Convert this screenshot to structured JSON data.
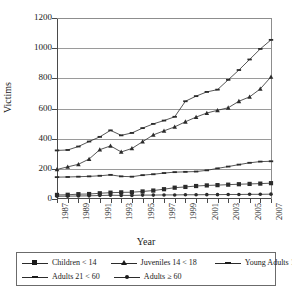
{
  "chart_data": {
    "type": "line",
    "title": "",
    "xlabel": "Year",
    "ylabel": "Victims",
    "ylim": [
      0,
      1200
    ],
    "ytick_values": [
      0,
      200,
      400,
      600,
      800,
      1000,
      1200
    ],
    "ytick_labels": [
      "0",
      "200",
      "400",
      "600",
      "800",
      "1000",
      "1200"
    ],
    "grid": true,
    "legend_position": "bottom",
    "x": [
      1987,
      1988,
      1989,
      1990,
      1991,
      1992,
      1993,
      1994,
      1995,
      1996,
      1997,
      1998,
      1999,
      2000,
      2001,
      2002,
      2003,
      2004,
      2005,
      2006,
      2007
    ],
    "xtick_labels": [
      "1987",
      "1989",
      "1991",
      "1993",
      "1995",
      "1997",
      "1999",
      "2001",
      "2003",
      "2005",
      "2007"
    ],
    "xtick_years": [
      1987,
      1989,
      1991,
      1993,
      1995,
      1997,
      1999,
      2001,
      2003,
      2005,
      2007
    ],
    "series": [
      {
        "name": "Children < 14",
        "marker": "square",
        "values": [
          27,
          28,
          32,
          33,
          38,
          42,
          44,
          45,
          50,
          56,
          65,
          75,
          80,
          86,
          90,
          92,
          95,
          98,
          100,
          102,
          105
        ]
      },
      {
        "name": "Juveniles 14 < 18",
        "marker": "triangle",
        "values": [
          196,
          213,
          230,
          265,
          327,
          352,
          312,
          335,
          380,
          425,
          452,
          478,
          512,
          543,
          570,
          588,
          605,
          648,
          677,
          730,
          810
        ]
      },
      {
        "name": "Young Adults 18 < 21",
        "marker": "dash",
        "values": [
          322,
          325,
          348,
          381,
          412,
          455,
          422,
          438,
          470,
          498,
          520,
          545,
          648,
          682,
          710,
          725,
          790,
          855,
          925,
          995,
          1055
        ]
      },
      {
        "name": "Adults 21 < 60",
        "marker": "dash",
        "values": [
          145,
          146,
          148,
          150,
          154,
          160,
          150,
          148,
          158,
          164,
          172,
          178,
          180,
          182,
          190,
          203,
          215,
          228,
          240,
          248,
          250
        ]
      },
      {
        "name": "Adults ≥ 60",
        "marker": "dot",
        "values": [
          18,
          19,
          20,
          21,
          23,
          25,
          24,
          24,
          26,
          26,
          27,
          27,
          28,
          28,
          29,
          29,
          30,
          30,
          31,
          31,
          32
        ]
      }
    ]
  },
  "legend": {
    "items": [
      {
        "label": "Children < 14",
        "marker": "square"
      },
      {
        "label": "Juveniles 14 < 18",
        "marker": "triangle"
      },
      {
        "label": "Young Adults 18 < 21",
        "marker": "dash"
      },
      {
        "label": "Adults 21 < 60",
        "marker": "dash"
      },
      {
        "label": "Adults ≥ 60",
        "marker": "dot"
      }
    ]
  },
  "colors": {
    "line": "#2b2b2b",
    "grid": "#9a9a9a",
    "axis": "#4a4a4a",
    "text": "#1a1a1a",
    "background": "#ffffff"
  }
}
